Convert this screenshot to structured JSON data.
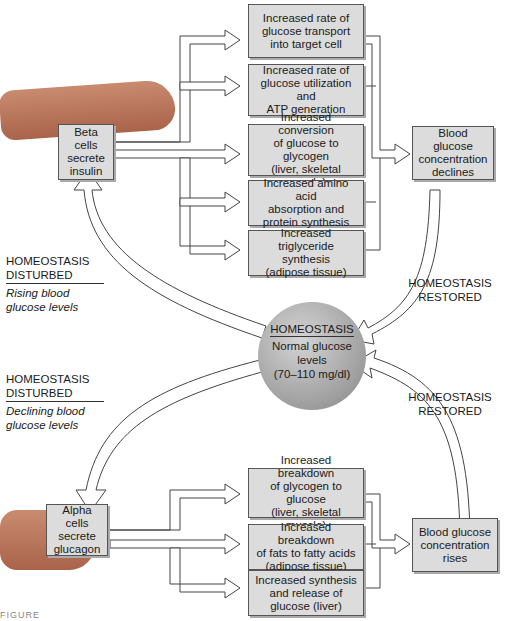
{
  "diagram": {
    "top_loop": {
      "source": "Beta cells\nsecrete\ninsulin",
      "effects": [
        "Increased rate of\nglucose transport\ninto target cell",
        "Increased rate of\nglucose utilization and\nATP generation",
        "Increased conversion\nof glucose to glycogen\n(liver, skeletal muscle)",
        "Increased amino acid\nabsorption and\nprotein synthesis",
        "Increased triglyceride\nsynthesis\n(adipose tissue)"
      ],
      "result": "Blood glucose\nconcentration\ndeclines",
      "disturbed_title": "HOMEOSTASIS\nDISTURBED",
      "disturbed_sub": "Rising blood\nglucose levels",
      "restored": "HOMEOSTASIS\nRESTORED"
    },
    "center": {
      "title": "HOMEOSTASIS",
      "body": "Normal glucose\nlevels\n(70–110 mg/dl)"
    },
    "bottom_loop": {
      "source": "Alpha cells\nsecrete\nglucagon",
      "effects": [
        "Increased breakdown\nof glycogen to glucose\n(liver, skeletal muscle)",
        "Increased breakdown\nof fats to fatty acids\n(adipose tissue)",
        "Increased synthesis\nand release of\nglucose (liver)"
      ],
      "result": "Blood glucose\nconcentration\nrises",
      "disturbed_title": "HOMEOSTASIS\nDISTURBED",
      "disturbed_sub": "Declining blood\nglucose levels",
      "restored": "HOMEOSTASIS\nRESTORED"
    },
    "caption": "FIGURE"
  }
}
